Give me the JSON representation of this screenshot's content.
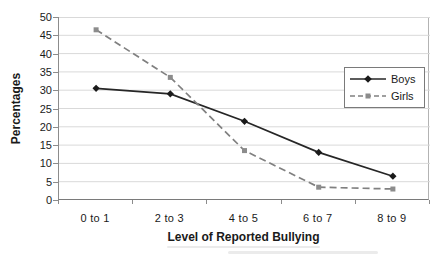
{
  "figure": {
    "y_axis_title": "Percentages",
    "x_axis_title": "Level of Reported Bullying"
  },
  "chart_data": {
    "type": "line",
    "categories": [
      "0 to 1",
      "2 to 3",
      "4 to 5",
      "6 to 7",
      "8 to 9"
    ],
    "series": [
      {
        "name": "Boys",
        "values": [
          30.5,
          29,
          21.5,
          13,
          6.5
        ],
        "color": "#262626",
        "marker": "diamond",
        "marker_color": "#1a1a1a",
        "line_style": "solid"
      },
      {
        "name": "Girls",
        "values": [
          46.5,
          33.5,
          13.5,
          3.5,
          3
        ],
        "color": "#808080",
        "marker": "square",
        "marker_color": "#8c8c8c",
        "line_style": "dashed"
      }
    ],
    "title": "",
    "xlabel": "Level of Reported Bullying",
    "ylabel": "Percentages",
    "ylim": [
      0,
      50
    ],
    "yticks": [
      50,
      45,
      40,
      35,
      30,
      25,
      20,
      15,
      10,
      5,
      0
    ],
    "grid": true,
    "gridline_color": "#d9d9d9",
    "axis_color": "#8c8c8c",
    "legend_position": "right-middle",
    "legend_border_color": "#7a7a7a"
  }
}
